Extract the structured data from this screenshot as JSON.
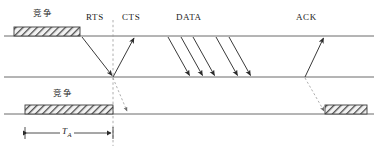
{
  "figure": {
    "type": "sequence-timing-diagram",
    "background_color": "#ffffff",
    "line_color": "#555555",
    "arrow_color": "#333333",
    "text_color": "#1a1a1a",
    "hatch_color": "#4a4a4a",
    "width": 378,
    "height": 153
  },
  "labels": {
    "contention_top": "竞争",
    "contention_bottom": "竞争",
    "rts": "RTS",
    "cts": "CTS",
    "data": "DATA",
    "ack": "ACK",
    "duration_symbol": "T",
    "duration_subscript": "A"
  },
  "timelines": [
    {
      "name": "station-a-timeline",
      "y": 36,
      "x_start": 4,
      "x_end": 374
    },
    {
      "name": "station-b-timeline",
      "y": 77,
      "x_start": 4,
      "x_end": 374
    },
    {
      "name": "station-c-timeline",
      "y": 114,
      "x_start": 4,
      "x_end": 374
    }
  ],
  "contention_bars": [
    {
      "name": "contention-bar-top",
      "x": 14,
      "y": 27,
      "width": 66,
      "height": 9
    },
    {
      "name": "contention-bar-bottom-left",
      "x": 25,
      "y": 105,
      "width": 88,
      "height": 9
    },
    {
      "name": "contention-bar-bottom-right",
      "x": 325,
      "y": 105,
      "width": 42,
      "height": 9
    }
  ],
  "arrows": [
    {
      "name": "rts-arrow",
      "label": "RTS",
      "x1": 82,
      "y1": 37,
      "x2": 113,
      "y2": 76,
      "style": "solid"
    },
    {
      "name": "cts-arrow",
      "label": "CTS",
      "x1": 113,
      "y1": 77,
      "x2": 134,
      "y2": 37,
      "style": "solid"
    },
    {
      "name": "data-arrow-1",
      "label": "DATA",
      "x1": 168,
      "y1": 37,
      "x2": 190,
      "y2": 76,
      "style": "solid"
    },
    {
      "name": "data-arrow-2",
      "label": "DATA",
      "x1": 181,
      "y1": 37,
      "x2": 203,
      "y2": 76,
      "style": "solid"
    },
    {
      "name": "data-arrow-3",
      "label": "DATA",
      "x1": 193,
      "y1": 37,
      "x2": 215,
      "y2": 76,
      "style": "solid"
    },
    {
      "name": "data-arrow-4",
      "label": "DATA",
      "x1": 216,
      "y1": 37,
      "x2": 238,
      "y2": 76,
      "style": "solid"
    },
    {
      "name": "data-arrow-5",
      "label": "DATA",
      "x1": 229,
      "y1": 37,
      "x2": 251,
      "y2": 76,
      "style": "solid"
    },
    {
      "name": "ack-arrow",
      "label": "ACK",
      "x1": 305,
      "y1": 77,
      "x2": 324,
      "y2": 37,
      "style": "solid"
    },
    {
      "name": "nav-dashed-arrow",
      "label": "",
      "x1": 305,
      "y1": 78,
      "x2": 325,
      "y2": 112,
      "style": "dashed"
    },
    {
      "name": "rts-dashed-arrow",
      "label": "",
      "x1": 113,
      "y1": 78,
      "x2": 128,
      "y2": 112,
      "style": "dashed"
    }
  ],
  "reference_line": {
    "name": "cts-reference-line",
    "x": 113,
    "y_top": 20,
    "y_bottom": 146,
    "style": "dashed"
  },
  "measurement": {
    "name": "ta-measurement",
    "x1": 25,
    "x2": 113,
    "y": 133,
    "tick_top": 127,
    "tick_bottom": 139
  },
  "label_positions": {
    "contention_top": {
      "x": 33,
      "y": 8
    },
    "rts": {
      "x": 86,
      "y": 13
    },
    "cts": {
      "x": 122,
      "y": 13
    },
    "data": {
      "x": 176,
      "y": 13
    },
    "ack": {
      "x": 296,
      "y": 13
    },
    "contention_bottom": {
      "x": 53,
      "y": 88
    },
    "duration": {
      "x": 63,
      "y": 125
    }
  }
}
